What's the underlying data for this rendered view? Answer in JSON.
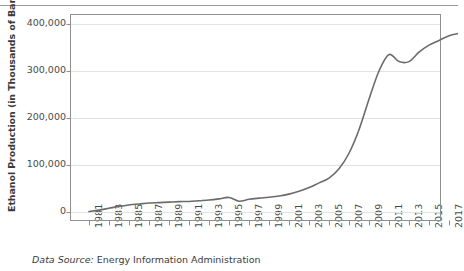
{
  "chart_data": {
    "type": "line",
    "title": "",
    "xlabel": "",
    "ylabel": "Ethanol Production (in Thousands of Barrels)",
    "ylim": [
      0,
      430000
    ],
    "xlim": [
      1980,
      2018
    ],
    "grid": true,
    "legend": false,
    "ytick_labels": [
      "0",
      "100,000",
      "200,000",
      "300,000",
      "400,000"
    ],
    "ytick_values": [
      0,
      100000,
      200000,
      300000,
      400000
    ],
    "xtick_labels": [
      "1981",
      "1983",
      "1985",
      "1987",
      "1989",
      "1991",
      "1993",
      "1995",
      "1997",
      "1999",
      "2001",
      "2003",
      "2005",
      "2007",
      "2009",
      "2011",
      "2013",
      "2015",
      "2017"
    ],
    "xtick_values": [
      1981,
      1983,
      1985,
      1987,
      1989,
      1991,
      1993,
      1995,
      1997,
      1999,
      2001,
      2003,
      2005,
      2007,
      2009,
      2011,
      2013,
      2015,
      2017
    ],
    "series": [
      {
        "name": "Ethanol Production",
        "color": "#6b6b6b",
        "x": [
          1981,
          1982,
          1983,
          1984,
          1985,
          1986,
          1987,
          1988,
          1989,
          1990,
          1991,
          1992,
          1993,
          1994,
          1995,
          1996,
          1997,
          1998,
          1999,
          2000,
          2001,
          2002,
          2003,
          2004,
          2005,
          2006,
          2007,
          2008,
          2009,
          2010,
          2011,
          2012,
          2013,
          2014,
          2015,
          2016,
          2017,
          2018
        ],
        "values": [
          1000,
          4000,
          8000,
          12000,
          15000,
          17000,
          19000,
          20000,
          21000,
          22000,
          22500,
          24000,
          25500,
          28000,
          31000,
          23000,
          27000,
          29500,
          31500,
          34000,
          38000,
          44000,
          52000,
          62000,
          72000,
          92000,
          125000,
          175000,
          240000,
          300000,
          335000,
          320000,
          320000,
          340000,
          355000,
          365000,
          375000,
          380000
        ]
      }
    ]
  },
  "figure": {
    "source_prefix": "Data Source:",
    "source_text": "Energy Information Administration"
  }
}
